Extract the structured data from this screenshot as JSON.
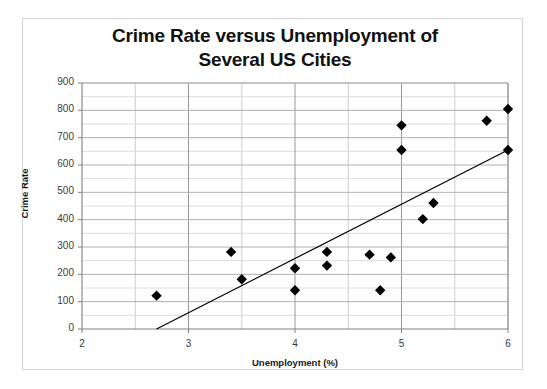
{
  "chart_data": {
    "type": "scatter",
    "title": "Crime Rate versus Unemployment of Several US Cities",
    "title_line1": "Crime Rate versus Unemployment of",
    "title_line2": "Several US Cities",
    "xlabel": "Unemployment (%)",
    "ylabel": "Crime Rate",
    "xlim": [
      2,
      6
    ],
    "ylim": [
      0,
      900
    ],
    "x_ticks": [
      2,
      3,
      4,
      5,
      6
    ],
    "y_ticks": [
      0,
      100,
      200,
      300,
      400,
      500,
      600,
      700,
      800,
      900
    ],
    "x_tick_labels": [
      "2",
      "3",
      "4",
      "5",
      "6"
    ],
    "y_tick_labels": [
      "0",
      "100",
      "200",
      "300",
      "400",
      "500",
      "600",
      "700",
      "800",
      "900"
    ],
    "x_minor_step": 0.5,
    "y_minor_step": 50,
    "grid": true,
    "legend": false,
    "marker": "diamond",
    "marker_color": "#000000",
    "points": [
      {
        "x": 2.7,
        "y": 122
      },
      {
        "x": 3.4,
        "y": 282
      },
      {
        "x": 3.5,
        "y": 182
      },
      {
        "x": 4.0,
        "y": 222
      },
      {
        "x": 4.0,
        "y": 142
      },
      {
        "x": 4.3,
        "y": 282
      },
      {
        "x": 4.3,
        "y": 232
      },
      {
        "x": 4.7,
        "y": 272
      },
      {
        "x": 4.8,
        "y": 142
      },
      {
        "x": 4.9,
        "y": 262
      },
      {
        "x": 5.0,
        "y": 745
      },
      {
        "x": 5.0,
        "y": 655
      },
      {
        "x": 5.2,
        "y": 402
      },
      {
        "x": 5.3,
        "y": 461
      },
      {
        "x": 5.8,
        "y": 762
      },
      {
        "x": 6.0,
        "y": 805
      },
      {
        "x": 6.0,
        "y": 655
      }
    ],
    "trendline": {
      "type": "line",
      "x_start": 2.7,
      "y_start": 0,
      "x_end": 6.0,
      "y_end": 655,
      "color": "#000000"
    }
  },
  "style": {
    "background": "#ffffff",
    "frame_border": "#d4d4d4",
    "major_gridline": "#999999",
    "minor_gridline": "#cccccc",
    "axis_line": "#808080",
    "text_color": "#111111"
  }
}
